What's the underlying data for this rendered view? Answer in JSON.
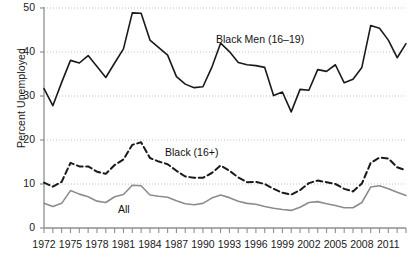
{
  "chart_data": {
    "type": "line",
    "title": "",
    "subtitle": "",
    "xlabel": "",
    "ylabel": "Percent Unemployed",
    "xlim": [
      1972,
      2013
    ],
    "ylim": [
      0,
      50
    ],
    "grid": true,
    "grid_axis": "y",
    "legend_position": "inline-annotations",
    "x": [
      1972,
      1973,
      1974,
      1975,
      1976,
      1977,
      1978,
      1979,
      1980,
      1981,
      1982,
      1983,
      1984,
      1985,
      1986,
      1987,
      1988,
      1989,
      1990,
      1991,
      1992,
      1993,
      1994,
      1995,
      1996,
      1997,
      1998,
      1999,
      2000,
      2001,
      2002,
      2003,
      2004,
      2005,
      2006,
      2007,
      2008,
      2009,
      2010,
      2011,
      2012,
      2013
    ],
    "xticks": [
      1972,
      1975,
      1978,
      1981,
      1984,
      1987,
      1990,
      1993,
      1996,
      1999,
      2002,
      2005,
      2008,
      2011
    ],
    "xtick_labels": [
      "1972",
      "1975",
      "1978",
      "1981",
      "1984",
      "1987",
      "1990",
      "1993",
      "1996",
      "1999",
      "2002",
      "2005",
      "2008",
      "2011"
    ],
    "yticks": [
      0,
      10,
      20,
      30,
      40,
      50
    ],
    "ytick_labels": [
      "0",
      "10",
      "20",
      "30",
      "40",
      "50"
    ],
    "series": [
      {
        "name": "Black Men (16-19)",
        "label": "Black Men (16–19)",
        "style": "solid",
        "color": "#1a1a1a",
        "width": 1.6,
        "values": [
          31.7,
          27.8,
          33.1,
          38.1,
          37.5,
          39.2,
          36.7,
          34.2,
          37.5,
          40.7,
          48.9,
          48.8,
          42.7,
          41.0,
          39.3,
          34.4,
          32.7,
          31.9,
          32.1,
          36.5,
          42.0,
          40.1,
          37.6,
          37.1,
          36.9,
          36.5,
          30.1,
          30.9,
          26.4,
          31.5,
          31.3,
          36.0,
          35.6,
          37.1,
          33.0,
          33.8,
          36.5,
          46.0,
          45.4,
          42.7,
          38.7,
          41.9
        ]
      },
      {
        "name": "Black (16+)",
        "label": "Black (16+)",
        "style": "dashed",
        "color": "#1a1a1a",
        "width": 2.0,
        "values": [
          10.3,
          9.4,
          10.5,
          14.8,
          14.0,
          14.0,
          12.8,
          12.3,
          14.3,
          15.6,
          18.9,
          19.5,
          15.9,
          15.1,
          14.5,
          13.0,
          11.7,
          11.4,
          11.4,
          12.5,
          14.2,
          13.0,
          11.5,
          10.4,
          10.5,
          10.0,
          8.9,
          8.0,
          7.6,
          8.6,
          10.2,
          10.8,
          10.4,
          10.0,
          8.9,
          8.3,
          10.1,
          14.8,
          16.0,
          15.8,
          13.8,
          13.1
        ]
      },
      {
        "name": "All",
        "label": "All",
        "style": "solid",
        "color": "#8c8c8c",
        "width": 1.6,
        "values": [
          5.6,
          4.9,
          5.6,
          8.5,
          7.7,
          7.1,
          6.1,
          5.8,
          7.1,
          7.6,
          9.7,
          9.6,
          7.5,
          7.2,
          7.0,
          6.2,
          5.5,
          5.3,
          5.6,
          6.8,
          7.5,
          6.9,
          6.1,
          5.6,
          5.4,
          4.9,
          4.5,
          4.2,
          4.0,
          4.7,
          5.8,
          6.0,
          5.5,
          5.1,
          4.6,
          4.6,
          5.8,
          9.3,
          9.6,
          8.9,
          8.1,
          7.4
        ]
      }
    ]
  },
  "annotations": {
    "black_men": "Black Men (16–19)",
    "black_all": "Black (16+)",
    "all": "All"
  },
  "colors": {
    "axis": "#8f8f8f",
    "grid": "#b9b9b9",
    "text": "#1a1a1a",
    "black_men_line": "#1a1a1a",
    "black_line": "#1a1a1a",
    "all_line": "#8c8c8c",
    "background": "#ffffff"
  }
}
